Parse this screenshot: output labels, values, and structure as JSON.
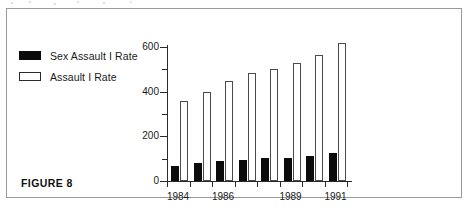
{
  "figure": {
    "caption": "FIGURE 8"
  },
  "legend": {
    "position": "top-left",
    "items": [
      {
        "label": "Sex Assault I Rate",
        "swatch": "filled-black-square-icon",
        "color": "#0b0b0b"
      },
      {
        "label": "Assault I Rate",
        "swatch": "hollow-white-square-icon",
        "color": "#ffffff"
      }
    ]
  },
  "chart_data": {
    "type": "bar",
    "title": "",
    "subtitle": "",
    "xlabel": "",
    "ylabel": "",
    "grid": false,
    "legend_position": "top-left",
    "ylim": [
      0,
      620
    ],
    "y_ticks_major": [
      0,
      200,
      400,
      600
    ],
    "y_ticks_minor": [
      100,
      300,
      500
    ],
    "y_tick_labels": [
      "0",
      "200",
      "400",
      "600"
    ],
    "categories": [
      "1984",
      "1985",
      "1986",
      "1987",
      "1988",
      "1989",
      "1990",
      "1991"
    ],
    "x_tick_labels_shown": [
      "1984",
      "1986",
      "1989",
      "1991"
    ],
    "series": [
      {
        "name": "Sex Assault I Rate",
        "color": "#0b0b0b",
        "values": [
          65,
          80,
          88,
          95,
          103,
          105,
          112,
          125
        ]
      },
      {
        "name": "Assault I Rate",
        "color": "#ffffff",
        "values": [
          360,
          400,
          448,
          485,
          503,
          530,
          565,
          618
        ]
      }
    ]
  }
}
